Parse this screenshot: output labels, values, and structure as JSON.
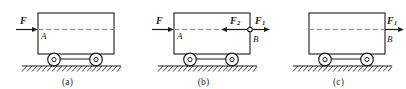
{
  "figure": {
    "type": "mechanics-free-body-diagrams",
    "background_color": "#ffffff",
    "line_color": "#1c1c1c",
    "dash_color": "#8c8c8c"
  },
  "panels": [
    {
      "id": "a",
      "caption": "(a)",
      "forces": [
        {
          "name": "F",
          "symbol": "F",
          "subscript": "",
          "direction": "right",
          "location": "outside-left"
        }
      ],
      "points": [
        {
          "name": "A",
          "label": "A",
          "location": "inside-left"
        }
      ],
      "has_hinge_dot": false
    },
    {
      "id": "b",
      "caption": "(b)",
      "forces": [
        {
          "name": "F",
          "symbol": "F",
          "subscript": "",
          "direction": "right",
          "location": "outside-left"
        },
        {
          "name": "F2",
          "symbol": "F",
          "subscript": "2",
          "direction": "left",
          "location": "inside-right"
        },
        {
          "name": "F1",
          "symbol": "F",
          "subscript": "1",
          "direction": "right",
          "location": "outside-right"
        }
      ],
      "points": [
        {
          "name": "A",
          "label": "A",
          "location": "inside-left"
        },
        {
          "name": "B",
          "label": "B",
          "location": "outside-right-below"
        }
      ],
      "has_hinge_dot": true
    },
    {
      "id": "c",
      "caption": "(c)",
      "forces": [
        {
          "name": "F1",
          "symbol": "F",
          "subscript": "1",
          "direction": "right",
          "location": "outside-right"
        }
      ],
      "points": [
        {
          "name": "B",
          "label": "B",
          "location": "outside-right-below"
        }
      ],
      "has_hinge_dot": false
    }
  ]
}
